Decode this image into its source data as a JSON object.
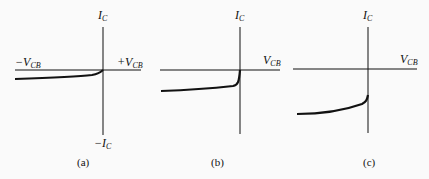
{
  "figure": {
    "panels": [
      {
        "id": "a",
        "caption": "(a)",
        "y_axis_top_label": {
          "main": "I",
          "sub": "C"
        },
        "y_axis_bottom_label": {
          "main": "−I",
          "sub": "C"
        },
        "x_axis_left_label": {
          "main": "−V",
          "sub": "CB"
        },
        "x_axis_right_label": {
          "main": "+V",
          "sub": "CB"
        },
        "curve": "small reverse saturation current below axis, rising to origin"
      },
      {
        "id": "b",
        "caption": "(b)",
        "y_axis_top_label": {
          "main": "I",
          "sub": "C"
        },
        "x_axis_right_label": {
          "main": "V",
          "sub": "CB"
        },
        "curve": "moderate current below axis, rising steeply near origin"
      },
      {
        "id": "c",
        "caption": "(c)",
        "y_axis_top_label": {
          "main": "I",
          "sub": "C"
        },
        "x_axis_right_label": {
          "main": "V",
          "sub": "CB"
        },
        "curve": "larger current below axis, rising steeply near vertical axis"
      }
    ],
    "colors": {
      "ink": "#111111",
      "background": "#fafafa"
    }
  }
}
